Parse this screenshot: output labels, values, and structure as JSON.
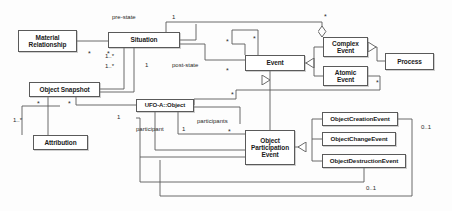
{
  "diagram": {
    "type": "uml-class-diagram",
    "stroke_color": "#5a5a5a",
    "fill_color": "#ffffff",
    "text_color": "#1b1b1b",
    "classes": [
      {
        "id": "material-relationship",
        "label": "Material\nRelationship",
        "line1": "Material",
        "line2": "Relationship",
        "x": 18,
        "y": 30,
        "w": 59,
        "h": 22,
        "font": 6.5
      },
      {
        "id": "situation",
        "label": "Situation",
        "line1": "Situation",
        "line2": "",
        "x": 108,
        "y": 32,
        "w": 72,
        "h": 16,
        "font": 6.5
      },
      {
        "id": "object-snapshot",
        "label": "Object Snapshot",
        "line1": "Object Snapshot",
        "line2": "",
        "x": 29,
        "y": 82,
        "w": 71,
        "h": 15,
        "font": 6.5
      },
      {
        "id": "ufo-a-object",
        "label": "UFO-A::Object",
        "line1": "UFO-A::Object",
        "line2": "",
        "x": 136,
        "y": 99,
        "w": 58,
        "h": 13,
        "font": 6
      },
      {
        "id": "attribution",
        "label": "Attribution",
        "line1": "Attribution",
        "line2": "",
        "x": 33,
        "y": 135,
        "w": 55,
        "h": 15,
        "font": 6.5
      },
      {
        "id": "event",
        "label": "Event",
        "line1": "Event",
        "line2": "",
        "x": 245,
        "y": 55,
        "w": 60,
        "h": 16,
        "font": 6.5
      },
      {
        "id": "complex-event",
        "label": "Complex\nEvent",
        "line1": "Complex",
        "line2": "Event",
        "x": 323,
        "y": 37,
        "w": 45,
        "h": 20,
        "font": 6.5
      },
      {
        "id": "atomic-event",
        "label": "Atomic\nEvent",
        "line1": "Atomic",
        "line2": "Event",
        "x": 323,
        "y": 66,
        "w": 45,
        "h": 20,
        "font": 6.5
      },
      {
        "id": "process",
        "label": "Process",
        "line1": "Process",
        "line2": "",
        "x": 385,
        "y": 53,
        "w": 49,
        "h": 17,
        "font": 6.5
      },
      {
        "id": "object-participation-event",
        "label": "Object\nParticipation\nEvent",
        "line1": "Object",
        "line2": "Participation",
        "line3": "Event",
        "x": 245,
        "y": 130,
        "w": 50,
        "h": 35,
        "font": 6.5
      },
      {
        "id": "object-creation-event",
        "label": "ObjectCreationEvent",
        "line1": "ObjectCreationEvent",
        "line2": "",
        "x": 322,
        "y": 112,
        "w": 76,
        "h": 14,
        "font": 6.2
      },
      {
        "id": "object-change-event",
        "label": "ObjectChangeEvent",
        "line1": "ObjectChangeEvent",
        "line2": "",
        "x": 322,
        "y": 132,
        "w": 74,
        "h": 14,
        "font": 6.2
      },
      {
        "id": "object-destruction-event",
        "label": "ObjectDestructionEvent",
        "line1": "ObjectDestructionEvent",
        "line2": "",
        "x": 322,
        "y": 154,
        "w": 84,
        "h": 14,
        "font": 6.2
      }
    ],
    "role_labels": [
      {
        "id": "pre-state",
        "text": "pre-state",
        "x": 112,
        "y": 14
      },
      {
        "id": "post-state",
        "text": "post-state",
        "x": 172,
        "y": 62
      },
      {
        "id": "participant",
        "text": "participant",
        "x": 136,
        "y": 126
      },
      {
        "id": "participants",
        "text": "participants",
        "x": 197,
        "y": 118
      }
    ],
    "multiplicities": [
      {
        "id": "mult-pre-state-one",
        "text": "1",
        "x": 172,
        "y": 14
      },
      {
        "id": "mult-situation-complex-star",
        "text": "*",
        "x": 324,
        "y": 14,
        "star": true
      },
      {
        "id": "mult-event-complex-star",
        "text": "*",
        "x": 253,
        "y": 36,
        "star": true
      },
      {
        "id": "mult-material-left-star",
        "text": "*",
        "x": 88,
        "y": 51,
        "star": true
      },
      {
        "id": "mult-material-right-star",
        "text": "*",
        "x": 107,
        "y": 51,
        "star": true
      },
      {
        "id": "mult-situation-event-star",
        "text": "*",
        "x": 226,
        "y": 39,
        "star": true
      },
      {
        "id": "mult-post-state-one",
        "text": "1",
        "x": 145,
        "y": 62
      },
      {
        "id": "mult-snapshot-situation-a",
        "text": "1..*",
        "x": 105,
        "y": 54
      },
      {
        "id": "mult-snapshot-situation-b",
        "text": "1..*",
        "x": 105,
        "y": 64
      },
      {
        "id": "mult-event-down-star",
        "text": "*",
        "x": 226,
        "y": 68,
        "star": true
      },
      {
        "id": "mult-atomic-side-star",
        "text": "*",
        "x": 376,
        "y": 80,
        "star": true
      },
      {
        "id": "mult-snapshot-attr-star",
        "text": "*",
        "x": 37,
        "y": 101,
        "star": true
      },
      {
        "id": "mult-snapshot-object-star",
        "text": "*",
        "x": 68,
        "y": 101,
        "star": true
      },
      {
        "id": "mult-object-top-star",
        "text": "*",
        "x": 231,
        "y": 92,
        "star": true
      },
      {
        "id": "mult-attribution-one-star",
        "text": "1..*",
        "x": 24,
        "y": 118
      },
      {
        "id": "mult-object-left-one",
        "text": "1",
        "x": 117,
        "y": 114
      },
      {
        "id": "mult-participant-one",
        "text": "1",
        "x": 182,
        "y": 126
      },
      {
        "id": "mult-participants-star",
        "text": "*",
        "x": 228,
        "y": 129,
        "star": true
      },
      {
        "id": "mult-creation-zero-one",
        "text": "0..1",
        "x": 421,
        "y": 124
      },
      {
        "id": "mult-destruction-zero-one",
        "text": "0..1",
        "x": 366,
        "y": 186
      }
    ]
  }
}
